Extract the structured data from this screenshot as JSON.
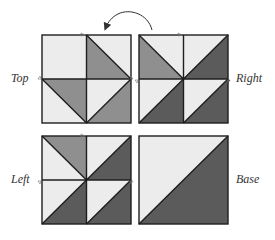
{
  "labels": {
    "top": "Top",
    "right": "Right",
    "left": "Left",
    "base": "Base"
  },
  "colors": {
    "light": "#ececec",
    "mid": "#8f8f8f",
    "dark": "#5b5b5b",
    "stroke": "#1e1e1e",
    "arrow": "#333333"
  },
  "blocks": [
    {
      "name": "top",
      "x": 42,
      "y": 35,
      "size": 89
    },
    {
      "name": "right",
      "x": 139,
      "y": 35,
      "size": 89
    },
    {
      "name": "left",
      "x": 42,
      "y": 136,
      "size": 89
    },
    {
      "name": "base",
      "x": 139,
      "y": 136,
      "size": 89
    }
  ],
  "arrow": {
    "direction": "counter-clockwise",
    "from": "right",
    "to": "top"
  }
}
